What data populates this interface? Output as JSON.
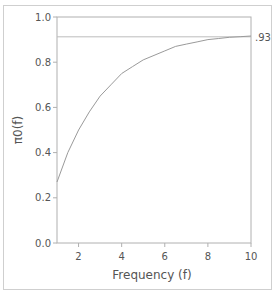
{
  "chart_data": {
    "type": "line",
    "title": "",
    "xlabel": "Frequency (f)",
    "ylabel": "π0(f)",
    "xlim": [
      1,
      10
    ],
    "ylim": [
      0,
      1.0
    ],
    "xticks": [
      2,
      4,
      6,
      8,
      10
    ],
    "xtick_labels": [
      "2",
      "4",
      "6",
      "8",
      "10"
    ],
    "yticks": [
      0.0,
      0.2,
      0.4,
      0.6,
      0.8,
      1.0
    ],
    "ytick_labels": [
      "0.0",
      "0.2",
      "0.4",
      "0.6",
      "0.8",
      "1.0"
    ],
    "grid": false,
    "legend": null,
    "series": [
      {
        "name": "π0(f)",
        "x": [
          1,
          1.5,
          2,
          2.5,
          3,
          3.5,
          4,
          4.5,
          5,
          5.5,
          6,
          6.5,
          7,
          7.5,
          8,
          8.5,
          9,
          9.5,
          10
        ],
        "values": [
          0.27,
          0.4,
          0.5,
          0.58,
          0.65,
          0.7,
          0.75,
          0.78,
          0.81,
          0.83,
          0.85,
          0.87,
          0.88,
          0.89,
          0.9,
          0.905,
          0.91,
          0.913,
          0.916
        ]
      }
    ],
    "reference_lines": [
      {
        "axis": "y",
        "value": 0.93,
        "label": ".93"
      }
    ]
  },
  "colors": {
    "curve": "#9a9a9a",
    "reference_line": "#bdbdbd",
    "axis": "#b0b0b0",
    "text": "#555555",
    "frame": "#cfcfcf"
  }
}
